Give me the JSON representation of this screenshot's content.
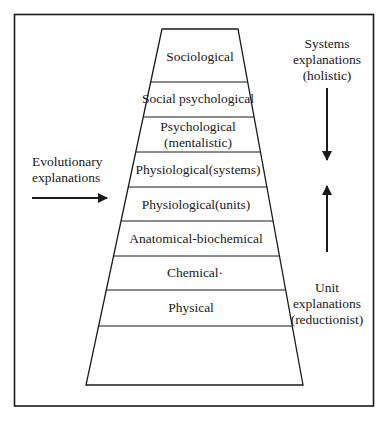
{
  "diagram": {
    "type": "layered-trapezoid",
    "layers": [
      {
        "label_line1": "Sociological",
        "label_line2": ""
      },
      {
        "label_line1": "Social psychological",
        "label_line2": ""
      },
      {
        "label_line1": "Psychological",
        "label_line2": "(mentalistic)"
      },
      {
        "label_line1": "Physiological(systems)",
        "label_line2": ""
      },
      {
        "label_line1": "Physiological(units)",
        "label_line2": ""
      },
      {
        "label_line1": "Anatomical-biochemical",
        "label_line2": ""
      },
      {
        "label_line1": "Chemical·",
        "label_line2": ""
      },
      {
        "label_line1": "Physical",
        "label_line2": ""
      },
      {
        "label_line1": "",
        "label_line2": ""
      }
    ],
    "left_annotation": {
      "line1": "Evolutionary",
      "line2": "explanations",
      "arrow": "arrow-right"
    },
    "right_top_annotation": {
      "line1": "Systems",
      "line2": "explanations",
      "line3": "(holistic)",
      "arrow": "arrow-down"
    },
    "right_bottom_annotation": {
      "line1": "Unit",
      "line2": "explanations",
      "line3": "(reductionist)",
      "arrow": "arrow-up"
    },
    "colors": {
      "line": "#1a1a1a",
      "background": "#ffffff"
    }
  }
}
